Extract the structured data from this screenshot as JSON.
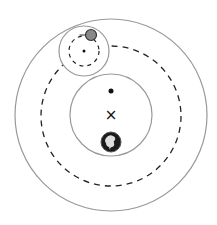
{
  "diagram": {
    "type": "geocentric-epicycle-model",
    "colors": {
      "solid_stroke": "#999999",
      "dashed_stroke": "#222222",
      "planet_fill": "#888888",
      "planet_stroke": "#333333",
      "earth_fill": "#1a1a1a",
      "land_fill": "#dddddd",
      "marker": "#111111"
    },
    "center_marker_glyph": "×",
    "elements": {
      "outer_circle": {
        "cx": 111,
        "cy": 115,
        "r": 96
      },
      "deferent": {
        "cx": 111,
        "cy": 116,
        "r": 70
      },
      "inner_circle": {
        "cx": 111,
        "cy": 115,
        "r": 41
      },
      "equant_dot": {
        "cx": 111,
        "cy": 91,
        "r": 2.5
      },
      "center_x": {
        "x": 111,
        "y": 115
      },
      "earth": {
        "cx": 111,
        "cy": 142,
        "r": 10
      },
      "epicycle_outer": {
        "cx": 84,
        "cy": 51,
        "r": 25
      },
      "epicycle": {
        "cx": 84,
        "cy": 51,
        "r": 15
      },
      "epicycle_center": {
        "cx": 84,
        "cy": 51,
        "r": 1.5
      },
      "planet": {
        "cx": 91,
        "cy": 35,
        "r": 5.5
      }
    }
  }
}
